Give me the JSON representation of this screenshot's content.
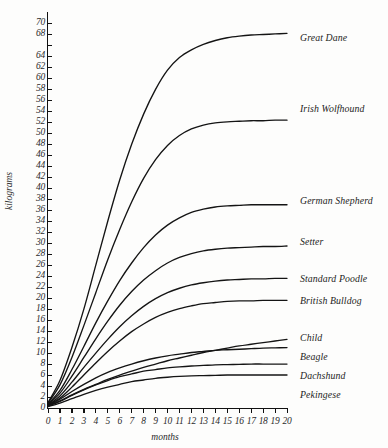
{
  "chart_data": {
    "type": "line",
    "title": "",
    "xlabel": "months",
    "ylabel": "kilograms",
    "xlim": [
      0,
      20
    ],
    "ylim": [
      0,
      71
    ],
    "grid": false,
    "legend_position": "right-inline-labels",
    "x": [
      0,
      1,
      2,
      3,
      4,
      5,
      6,
      7,
      8,
      9,
      10,
      11,
      12,
      13,
      14,
      15,
      16,
      17,
      18,
      19,
      20
    ],
    "x_tick_labels": [
      "0",
      "1",
      "2",
      "3",
      "4",
      "5",
      "6",
      "7",
      "8",
      "9",
      "10",
      "11",
      "12",
      "13",
      "14",
      "15",
      "16",
      "17",
      "18",
      "19",
      "20"
    ],
    "y_tick_labels": [
      "0",
      "2",
      "4",
      "6",
      "8",
      "10",
      "12",
      "14",
      "16",
      "18",
      "20",
      "22",
      "24",
      "26",
      "28",
      "30",
      "32",
      "34",
      "36",
      "38",
      "40",
      "42",
      "44",
      "46",
      "48",
      "50",
      "52",
      "54",
      "56",
      "58",
      "60",
      "62",
      "64",
      "",
      "68",
      "70"
    ],
    "y_tick_values": [
      0,
      2,
      4,
      6,
      8,
      10,
      12,
      14,
      16,
      18,
      20,
      22,
      24,
      26,
      28,
      30,
      32,
      34,
      36,
      38,
      40,
      42,
      44,
      46,
      48,
      50,
      52,
      54,
      56,
      58,
      60,
      62,
      64,
      66,
      68,
      70
    ],
    "series": [
      {
        "name": "Great Dane",
        "label": "Great Dane",
        "values": [
          1.0,
          5.0,
          11.0,
          18.0,
          26.0,
          34.0,
          41.5,
          48.0,
          53.5,
          58.0,
          61.5,
          63.8,
          65.2,
          66.2,
          66.9,
          67.4,
          67.7,
          67.9,
          68.0,
          68.1,
          68.2
        ]
      },
      {
        "name": "Irish Wolfhound",
        "label": "Irish Wolfhound",
        "values": [
          0.9,
          4.2,
          9.2,
          15.0,
          21.0,
          27.0,
          32.5,
          37.5,
          41.8,
          45.2,
          47.8,
          49.6,
          50.8,
          51.5,
          51.9,
          52.1,
          52.2,
          52.3,
          52.3,
          52.4,
          52.4
        ]
      },
      {
        "name": "German Shepherd",
        "label": "German Shepherd",
        "values": [
          0.7,
          3.2,
          7.0,
          11.2,
          15.5,
          19.5,
          23.2,
          26.4,
          29.2,
          31.5,
          33.3,
          34.6,
          35.6,
          36.2,
          36.6,
          36.8,
          36.9,
          37.0,
          37.0,
          37.0,
          37.0
        ]
      },
      {
        "name": "Setter",
        "label": "Setter",
        "values": [
          0.6,
          2.7,
          5.8,
          9.2,
          12.6,
          15.8,
          18.7,
          21.2,
          23.3,
          25.0,
          26.4,
          27.4,
          28.1,
          28.6,
          28.9,
          29.1,
          29.2,
          29.3,
          29.4,
          29.4,
          29.5
        ]
      },
      {
        "name": "Standard Poodle",
        "label": "Standard Poodle",
        "values": [
          0.5,
          2.2,
          4.7,
          7.4,
          10.0,
          12.5,
          14.8,
          16.8,
          18.5,
          19.9,
          21.0,
          21.8,
          22.4,
          22.8,
          23.1,
          23.3,
          23.4,
          23.5,
          23.5,
          23.6,
          23.6
        ]
      },
      {
        "name": "British Bulldog",
        "label": "British Bulldog",
        "values": [
          0.5,
          1.8,
          3.8,
          6.0,
          8.2,
          10.3,
          12.2,
          13.9,
          15.3,
          16.5,
          17.4,
          18.1,
          18.6,
          19.0,
          19.2,
          19.4,
          19.5,
          19.5,
          19.6,
          19.6,
          19.6
        ]
      },
      {
        "name": "Child",
        "label": "Child",
        "values": [
          0.4,
          1.3,
          2.4,
          3.4,
          4.3,
          5.2,
          6.0,
          6.7,
          7.4,
          8.0,
          8.6,
          9.1,
          9.6,
          10.1,
          10.5,
          10.9,
          11.3,
          11.6,
          11.9,
          12.2,
          12.5
        ]
      },
      {
        "name": "Beagle",
        "label": "Beagle",
        "values": [
          0.4,
          1.6,
          3.0,
          4.3,
          5.5,
          6.5,
          7.3,
          8.0,
          8.6,
          9.1,
          9.5,
          9.8,
          10.1,
          10.3,
          10.5,
          10.6,
          10.7,
          10.8,
          10.9,
          10.95,
          11.0
        ]
      },
      {
        "name": "Dachshund",
        "label": "Dachshund",
        "values": [
          0.3,
          1.2,
          2.3,
          3.3,
          4.2,
          5.0,
          5.7,
          6.2,
          6.7,
          7.0,
          7.3,
          7.5,
          7.65,
          7.75,
          7.85,
          7.9,
          7.95,
          8.0,
          8.0,
          8.0,
          8.0
        ]
      },
      {
        "name": "Pekingese",
        "label": "Pekingese",
        "values": [
          0.25,
          0.9,
          1.7,
          2.5,
          3.2,
          3.8,
          4.3,
          4.8,
          5.1,
          5.4,
          5.6,
          5.75,
          5.85,
          5.9,
          5.95,
          6.0,
          6.0,
          6.0,
          6.0,
          6.0,
          6.0
        ]
      }
    ],
    "series_label_positions": [
      {
        "name": "Great Dane",
        "top": 33
      },
      {
        "name": "Irish Wolfhound",
        "top": 104
      },
      {
        "name": "German Shepherd",
        "top": 196
      },
      {
        "name": "Setter",
        "top": 237
      },
      {
        "name": "Standard Poodle",
        "top": 274
      },
      {
        "name": "British Bulldog",
        "top": 296
      },
      {
        "name": "Child",
        "top": 333
      },
      {
        "name": "Beagle",
        "top": 352
      },
      {
        "name": "Dachshund",
        "top": 371
      },
      {
        "name": "Pekingese",
        "top": 390
      }
    ]
  }
}
